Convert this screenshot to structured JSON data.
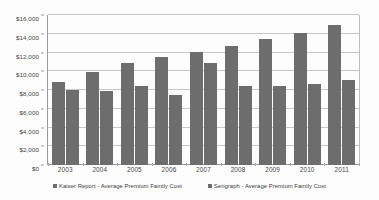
{
  "chart_data": {
    "type": "bar",
    "title": "",
    "xlabel": "",
    "ylabel": "",
    "categories": [
      "2003",
      "2004",
      "2005",
      "2006",
      "2007",
      "2008",
      "2009",
      "2010",
      "2011"
    ],
    "series": [
      {
        "name": "Kaiser Report - Average Premium Family Cost",
        "color": "#6d6d6d",
        "values": [
          8900,
          9950,
          10900,
          11500,
          12050,
          12700,
          13400,
          14050,
          14900
        ]
      },
      {
        "name": "Serigraph - Average Premium Family Cost",
        "color": "#6d6d6d",
        "values": [
          8000,
          7900,
          8450,
          7450,
          10900,
          8400,
          8400,
          8650,
          9100
        ]
      }
    ],
    "ylim": [
      0,
      16000
    ],
    "ytick_values": [
      0,
      2000,
      4000,
      6000,
      8000,
      10000,
      12000,
      14000,
      16000
    ],
    "ytick_labels": [
      "$0",
      "$2,000",
      "$4,000",
      "$6,000",
      "$8,000",
      "$10,000",
      "$12,000",
      "$14,000",
      "$16,000"
    ],
    "grid": true,
    "legend_position": "bottom"
  },
  "legend": {
    "entries": [
      {
        "label": "Kaiser Report - Average Premium Family Cost"
      },
      {
        "label": "Serigraph - Average Premium Family Cost"
      }
    ]
  },
  "colors": {
    "bar": "#6d6d6d",
    "gridline": "#c8c8c8",
    "axis": "#9a9a9a",
    "background": "#fdfdfd",
    "text": "#3a3a3a"
  }
}
